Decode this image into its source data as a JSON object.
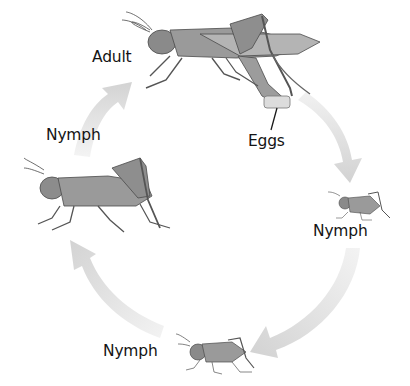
{
  "diagram": {
    "type": "life-cycle",
    "colors": {
      "arrow": "#d6d6d6",
      "arrow_light": "#ececec",
      "insect_body": "#8c8c8c",
      "insect_dark": "#505050",
      "text": "#141414"
    },
    "stages": [
      {
        "id": "adult",
        "label": "Adult"
      },
      {
        "id": "eggs",
        "label": "Eggs"
      },
      {
        "id": "nymph-small",
        "label": "Nymph"
      },
      {
        "id": "nymph-medium",
        "label": "Nymph"
      },
      {
        "id": "nymph-large",
        "label": "Nymph"
      }
    ],
    "cycle_order": [
      "adult",
      "eggs",
      "nymph-small",
      "nymph-medium",
      "nymph-large",
      "adult"
    ]
  }
}
